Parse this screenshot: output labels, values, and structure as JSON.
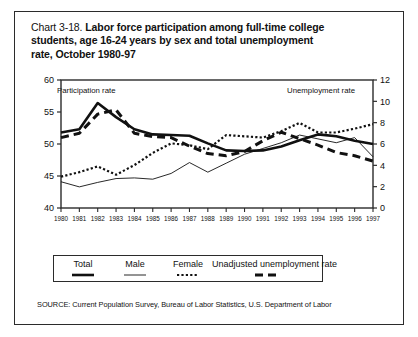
{
  "figure": {
    "title_prefix": "Chart 3-18.",
    "title_line1": "Labor force participation among full-time college",
    "title_line2": "students, age 16-24 years by sex and total unemployment",
    "title_line3": "rate, October 1980-97",
    "source": "SOURCE: Current Population Survey, Bureau of Labor Statistics, U.S. Department of Labor",
    "left_axis_caption": "Participation rate",
    "right_axis_caption": "Unemployment rate",
    "frame_color": "#2b2b2b"
  },
  "legend": {
    "entries": [
      {
        "label": "Total",
        "style": "thick-solid"
      },
      {
        "label": "Male",
        "style": "thin-solid"
      },
      {
        "label": "Female",
        "style": "dotted"
      },
      {
        "label": "Unadjusted unemployment rate",
        "style": "dashed"
      }
    ]
  },
  "chart_data": {
    "type": "line",
    "title": "Labor force participation among full-time college students, age 16-24 years by sex and total unemployment rate, October 1980-97",
    "xlabel": "",
    "ylabel": "Participation rate",
    "y2label": "Unemployment rate",
    "grid": false,
    "legend_position": "bottom",
    "x": [
      1980,
      1981,
      1982,
      1983,
      1984,
      1985,
      1986,
      1987,
      1988,
      1989,
      1990,
      1991,
      1992,
      1993,
      1994,
      1995,
      1996,
      1997
    ],
    "categories": [
      "1980",
      "1981",
      "1982",
      "1983",
      "1984",
      "1985",
      "1986",
      "1987",
      "1988",
      "1989",
      "1990",
      "1991",
      "1992",
      "1993",
      "1994",
      "1995",
      "1996",
      "1997"
    ],
    "ylim": [
      40,
      60
    ],
    "yticks": [
      40,
      45,
      50,
      55,
      60
    ],
    "y2lim": [
      0,
      12
    ],
    "y2ticks": [
      0,
      2,
      4,
      6,
      8,
      10,
      12
    ],
    "series": [
      {
        "name": "Total",
        "axis": "left",
        "style": "thick-solid",
        "values": [
          51.8,
          52.3,
          56.4,
          54.2,
          52.3,
          51.5,
          51.4,
          51.3,
          50.1,
          49.0,
          48.9,
          49.0,
          49.6,
          50.6,
          51.5,
          51.2,
          50.5,
          50.0
        ]
      },
      {
        "name": "Male",
        "axis": "left",
        "style": "thin-solid",
        "values": [
          44.1,
          43.3,
          44.0,
          44.6,
          44.7,
          44.5,
          45.4,
          47.1,
          45.6,
          47.0,
          48.4,
          49.3,
          50.2,
          51.4,
          50.8,
          50.2,
          51.0,
          48.0
        ]
      },
      {
        "name": "Female",
        "axis": "left",
        "style": "dotted",
        "values": [
          44.9,
          45.6,
          46.5,
          45.2,
          46.7,
          48.6,
          50.1,
          49.8,
          49.2,
          51.4,
          51.2,
          51.0,
          52.0,
          53.3,
          51.8,
          51.8,
          52.4,
          53.1
        ]
      },
      {
        "name": "Unadjusted unemployment rate",
        "axis": "right",
        "style": "dashed",
        "values": [
          6.6,
          7.0,
          8.8,
          9.2,
          7.0,
          6.7,
          6.6,
          5.8,
          5.1,
          4.9,
          5.3,
          6.3,
          7.1,
          6.5,
          5.9,
          5.2,
          4.9,
          4.4
        ]
      }
    ]
  }
}
